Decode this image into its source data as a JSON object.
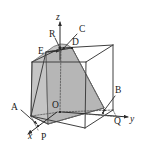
{
  "figure": {
    "background_color": "#ffffff",
    "line_color": "#404040",
    "shade_color": "#b9b9b9"
  },
  "axes": [
    {
      "id": "x",
      "label": "x",
      "x": 31,
      "y": 136,
      "direction": "lower-left"
    },
    {
      "id": "y",
      "label": "y",
      "x": 132,
      "y": 120,
      "direction": "right"
    },
    {
      "id": "z",
      "label": "z",
      "x": 56,
      "y": 20,
      "direction": "up"
    }
  ],
  "points": [
    {
      "id": "O",
      "label": "O",
      "x": 57,
      "y": 104,
      "note": "origin"
    },
    {
      "id": "A",
      "label": "A",
      "x": 14,
      "y": 110
    },
    {
      "id": "B",
      "label": "B",
      "x": 118,
      "y": 93
    },
    {
      "id": "C",
      "label": "C",
      "x": 79,
      "y": 30
    },
    {
      "id": "D",
      "label": "D",
      "x": 74,
      "y": 46
    },
    {
      "id": "E",
      "label": "E",
      "x": 42,
      "y": 51
    },
    {
      "id": "P",
      "label": "P",
      "x": 41,
      "y": 139
    },
    {
      "id": "Q",
      "label": "Q",
      "x": 118,
      "y": 120
    },
    {
      "id": "R",
      "label": "R",
      "x": 53,
      "y": 33
    }
  ],
  "cube": {
    "description": "wireframe cube drawn in oblique projection",
    "visible_edges": 9,
    "hidden_edges": 3
  },
  "cross_section": {
    "description": "shaded planar cut through the cube",
    "vertices": [
      "E",
      "D",
      "Q-side",
      "P-side"
    ]
  }
}
